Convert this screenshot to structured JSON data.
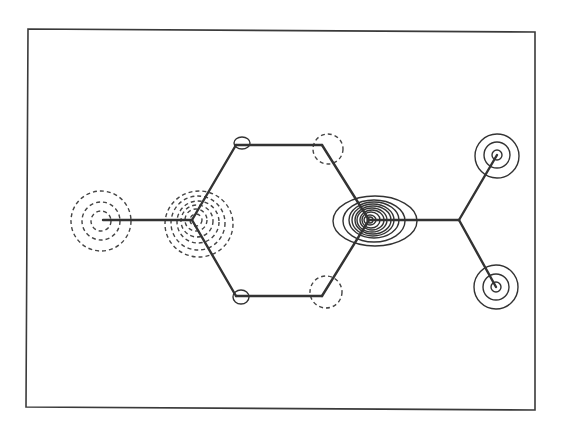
{
  "figure": {
    "width": 563,
    "height": 438,
    "background": "#ffffff",
    "ink_color": "#333333",
    "frame": {
      "points": "28,29 535,32 535,410 26,407"
    }
  },
  "molecule": {
    "bonds": [
      {
        "name": "bond-left-substituent",
        "x1": 103,
        "y1": 220,
        "x2": 192,
        "y2": 220
      },
      {
        "name": "bond-ring-c1-c2",
        "x1": 192,
        "y1": 220,
        "x2": 236,
        "y2": 145
      },
      {
        "name": "bond-ring-c2-c3",
        "x1": 236,
        "y1": 145,
        "x2": 322,
        "y2": 145
      },
      {
        "name": "bond-ring-c3-c4",
        "x1": 322,
        "y1": 145,
        "x2": 369,
        "y2": 220
      },
      {
        "name": "bond-ring-c4-c5",
        "x1": 369,
        "y1": 220,
        "x2": 322,
        "y2": 296
      },
      {
        "name": "bond-ring-c5-c6",
        "x1": 322,
        "y1": 296,
        "x2": 236,
        "y2": 296
      },
      {
        "name": "bond-ring-c6-c1",
        "x1": 236,
        "y1": 296,
        "x2": 192,
        "y2": 220
      },
      {
        "name": "bond-right-substituent",
        "x1": 369,
        "y1": 220,
        "x2": 459,
        "y2": 220
      },
      {
        "name": "bond-branch-upper",
        "x1": 459,
        "y1": 220,
        "x2": 497,
        "y2": 155
      },
      {
        "name": "bond-branch-lower",
        "x1": 459,
        "y1": 220,
        "x2": 496,
        "y2": 287
      }
    ]
  },
  "contours": {
    "dashed_negative": [
      {
        "group": "left-atom",
        "cx": 101,
        "cy": 221,
        "rx": 10,
        "ry": 10
      },
      {
        "group": "left-atom",
        "cx": 101,
        "cy": 221,
        "rx": 19,
        "ry": 19
      },
      {
        "group": "left-atom",
        "cx": 101,
        "cy": 221,
        "rx": 30,
        "ry": 30
      },
      {
        "group": "ring-c1",
        "cx": 196,
        "cy": 220,
        "rx": 6,
        "ry": 6
      },
      {
        "group": "ring-c1",
        "cx": 196,
        "cy": 220,
        "rx": 11,
        "ry": 11
      },
      {
        "group": "ring-c1",
        "cx": 197,
        "cy": 221,
        "rx": 16,
        "ry": 16
      },
      {
        "group": "ring-c1",
        "cx": 198,
        "cy": 222,
        "rx": 21,
        "ry": 21
      },
      {
        "group": "ring-c1",
        "cx": 198,
        "cy": 223,
        "rx": 27,
        "ry": 27
      },
      {
        "group": "ring-c1",
        "cx": 199,
        "cy": 224,
        "rx": 34,
        "ry": 33
      },
      {
        "group": "ring-c3",
        "cx": 328,
        "cy": 149,
        "rx": 15,
        "ry": 15
      },
      {
        "group": "ring-c5",
        "cx": 326,
        "cy": 292,
        "rx": 16,
        "ry": 16
      }
    ],
    "solid_positive": [
      {
        "group": "ring-c2",
        "cx": 242,
        "cy": 143,
        "rx": 8,
        "ry": 6
      },
      {
        "group": "ring-c6",
        "cx": 241,
        "cy": 297,
        "rx": 8,
        "ry": 7
      },
      {
        "group": "ring-c4",
        "cx": 370,
        "cy": 220,
        "rx": 3,
        "ry": 3
      },
      {
        "group": "ring-c4",
        "cx": 370,
        "cy": 220,
        "rx": 6,
        "ry": 5
      },
      {
        "group": "ring-c4",
        "cx": 371,
        "cy": 220,
        "rx": 9,
        "ry": 8
      },
      {
        "group": "ring-c4",
        "cx": 372,
        "cy": 220,
        "rx": 12,
        "ry": 10
      },
      {
        "group": "ring-c4",
        "cx": 372,
        "cy": 220,
        "rx": 15,
        "ry": 12
      },
      {
        "group": "ring-c4",
        "cx": 373,
        "cy": 220,
        "rx": 18,
        "ry": 14
      },
      {
        "group": "ring-c4",
        "cx": 373,
        "cy": 220,
        "rx": 21,
        "ry": 16
      },
      {
        "group": "ring-c4",
        "cx": 374,
        "cy": 220,
        "rx": 25,
        "ry": 18
      },
      {
        "group": "ring-c4",
        "cx": 374,
        "cy": 221,
        "rx": 31,
        "ry": 21
      },
      {
        "group": "ring-c4",
        "cx": 375,
        "cy": 221,
        "rx": 42,
        "ry": 25
      },
      {
        "group": "upper-atom",
        "cx": 497,
        "cy": 155,
        "rx": 5,
        "ry": 5
      },
      {
        "group": "upper-atom",
        "cx": 497,
        "cy": 155,
        "rx": 13,
        "ry": 13
      },
      {
        "group": "upper-atom",
        "cx": 497,
        "cy": 156,
        "rx": 22,
        "ry": 22
      },
      {
        "group": "lower-atom",
        "cx": 496,
        "cy": 287,
        "rx": 5,
        "ry": 5
      },
      {
        "group": "lower-atom",
        "cx": 496,
        "cy": 287,
        "rx": 13,
        "ry": 13
      },
      {
        "group": "lower-atom",
        "cx": 496,
        "cy": 287,
        "rx": 22,
        "ry": 22
      }
    ]
  }
}
